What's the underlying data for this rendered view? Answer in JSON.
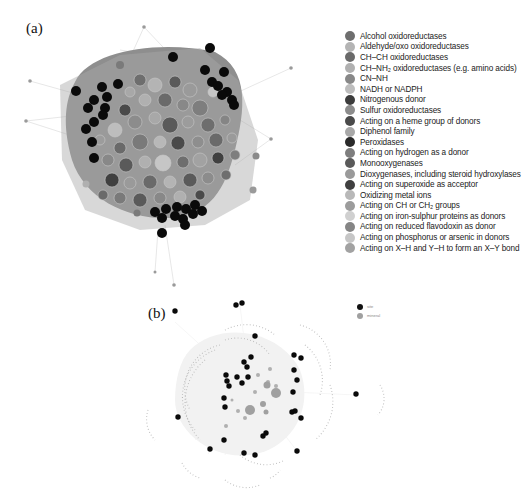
{
  "figure": {
    "panel_a": {
      "label": "(a)",
      "legend": [
        {
          "label": "Alcohol oxidoreductases",
          "color": "#6e6e6e"
        },
        {
          "label": "Aldehyde/oxo oxidoreductases",
          "color": "#b4b4b4"
        },
        {
          "label": "CH–CH  oxidoreductases",
          "color": "#6a6a6a"
        },
        {
          "label": "CH–NH₂ oxidoreductases (e.g. amino acids)",
          "color": "#b0b0b0"
        },
        {
          "label": "CN–NH",
          "color": "#888888"
        },
        {
          "label": "NADH or NADPH",
          "color": "#bdbdbd"
        },
        {
          "label": "Nitrogenous donor",
          "color": "#3c3c3c"
        },
        {
          "label": "Sulfur oxidoreductases",
          "color": "#8c8c8c"
        },
        {
          "label": "Acting on a heme group of donors",
          "color": "#4a4a4a"
        },
        {
          "label": "Diphenol family",
          "color": "#a8a8a8"
        },
        {
          "label": "Peroxidases",
          "color": "#2a2a2a"
        },
        {
          "label": "Acting on hydrogen as a donor",
          "color": "#7e7e7e"
        },
        {
          "label": "Monooxygenases",
          "color": "#5a5a5a"
        },
        {
          "label": "Dioxygenases, including steroid hydroxylases",
          "color": "#9a9a9a"
        },
        {
          "label": "Acting on superoxide as acceptor",
          "color": "#404040"
        },
        {
          "label": "Oxidizing metal ions",
          "color": "#b8b8b8"
        },
        {
          "label": "Acting on CH or CH₂ groups",
          "color": "#9c9c9c"
        },
        {
          "label": "Acting on iron-sulphur proteins as donors",
          "color": "#d0d0d0"
        },
        {
          "label": "Acting on reduced flavodoxin as donor",
          "color": "#858585"
        },
        {
          "label": "Acting on phosphorus or arsenic in donors",
          "color": "#c6c6c6"
        },
        {
          "label": "Acting on X–H and Y–H to form an X–Y bond",
          "color": "#a2a2a2"
        }
      ]
    },
    "panel_b": {
      "label": "(b)",
      "legend": [
        {
          "label": "site",
          "color": "#111111"
        },
        {
          "label": "mineral",
          "color": "#a0a0a0"
        }
      ]
    }
  }
}
